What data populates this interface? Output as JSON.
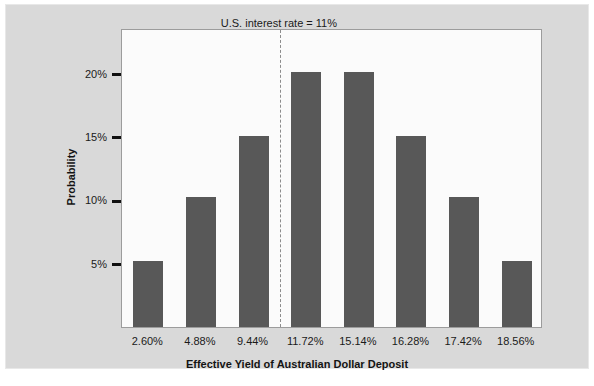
{
  "chart_data": {
    "type": "bar",
    "title": "",
    "xlabel": "Effective Yield of Australian Dollar Deposit",
    "ylabel": "Probability",
    "categories": [
      "2.60%",
      "4.88%",
      "9.44%",
      "11.72%",
      "15.14%",
      "16.28%",
      "17.42%",
      "18.56%"
    ],
    "values": [
      5.2,
      10.3,
      15.1,
      20.1,
      20.1,
      15.1,
      10.3,
      5.2
    ],
    "value_labels": [
      "5.2%",
      "10.3%",
      "15.1%",
      "20.1%",
      "20.1%",
      "15.1%",
      "10.3%",
      "5.2%"
    ],
    "ylim": [
      0,
      23.6
    ],
    "yticks": [
      5,
      10,
      15,
      20
    ],
    "ytick_labels": [
      "5%",
      "10%",
      "15%",
      "20%"
    ],
    "grid": false,
    "legend": "none",
    "bar_color": "#585858",
    "plot_background": "#fbfbfb",
    "canvas_background": "#d9d9d9",
    "annotations": [
      {
        "name": "us-interest-rate-threshold",
        "text": "U.S. interest rate = 11%",
        "x_value": 11,
        "line_style": "dashed",
        "line_color": "#8c8c8c"
      }
    ]
  }
}
